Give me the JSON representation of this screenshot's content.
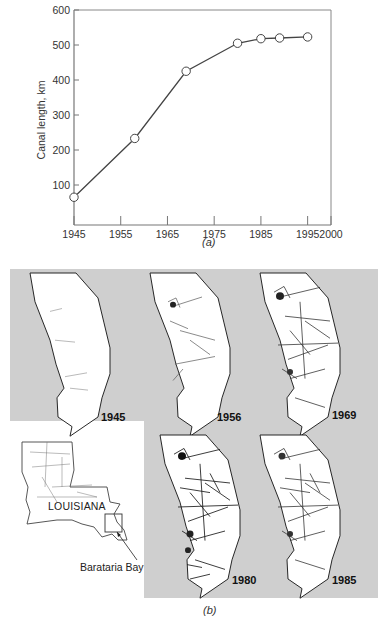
{
  "chart_data": {
    "type": "line",
    "title": "",
    "xlabel": "",
    "ylabel": "Canal length, km",
    "xlim": [
      1945,
      2000
    ],
    "ylim": [
      0,
      600
    ],
    "x": [
      1945,
      1958,
      1969,
      1980,
      1985,
      1989,
      1995
    ],
    "series": [
      {
        "name": "Canal length",
        "values": [
          65,
          233,
          425,
          505,
          518,
          520,
          523
        ],
        "marker": "open-circle"
      }
    ],
    "x_ticks": [
      "1945",
      "1955",
      "1965",
      "1975",
      "1985",
      "1995",
      "2000"
    ],
    "y_ticks": [
      "100",
      "200",
      "300",
      "400",
      "500",
      "600"
    ],
    "grid": false,
    "legend": null
  },
  "panel_a": {
    "caption": "(a)"
  },
  "panel_b": {
    "caption": "(b)",
    "maps": [
      {
        "year": "1945"
      },
      {
        "year": "1956"
      },
      {
        "year": "1969"
      },
      {
        "year": "1980"
      },
      {
        "year": "1985"
      }
    ],
    "inset": {
      "state_label": "LOUISIANA",
      "callout_label": "Barataria Bay"
    },
    "background_color": "#cfcfcf"
  }
}
